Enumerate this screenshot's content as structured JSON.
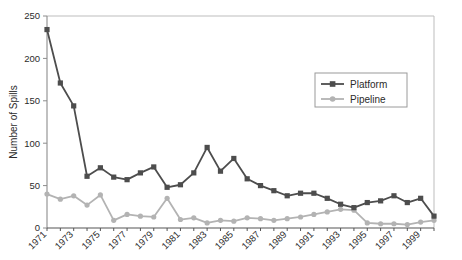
{
  "chart_data": {
    "type": "line",
    "title": "",
    "xlabel": "",
    "ylabel": "Number of Spills",
    "ylim": [
      0,
      250
    ],
    "yticks": [
      0,
      50,
      100,
      150,
      200,
      250
    ],
    "grid": false,
    "legend_position": "top-right",
    "x": [
      1971,
      1972,
      1973,
      1974,
      1975,
      1976,
      1977,
      1978,
      1979,
      1980,
      1981,
      1982,
      1983,
      1984,
      1985,
      1986,
      1987,
      1988,
      1989,
      1990,
      1991,
      1992,
      1993,
      1994,
      1995,
      1996,
      1997,
      1998,
      1999,
      2000
    ],
    "xtick_labels": [
      "1971",
      "1973",
      "1975",
      "1977",
      "1979",
      "1981",
      "1983",
      "1985",
      "1987",
      "1989",
      "1991",
      "1993",
      "1995",
      "1997",
      "1999"
    ],
    "xticks": [
      1971,
      1973,
      1975,
      1977,
      1979,
      1981,
      1983,
      1985,
      1987,
      1989,
      1991,
      1993,
      1995,
      1997,
      1999
    ],
    "series": [
      {
        "name": "Platform",
        "color": "#4d4d4d",
        "marker": "square",
        "values": [
          234,
          171,
          144,
          61,
          71,
          60,
          57,
          65,
          72,
          48,
          51,
          65,
          95,
          67,
          82,
          58,
          50,
          44,
          38,
          41,
          41,
          35,
          28,
          24,
          30,
          32,
          38,
          30,
          35,
          14
        ]
      },
      {
        "name": "Pipeline",
        "color": "#b3b3b3",
        "marker": "circle",
        "values": [
          40,
          34,
          38,
          27,
          39,
          9,
          16,
          14,
          13,
          35,
          10,
          12,
          6,
          9,
          8,
          12,
          11,
          9,
          11,
          13,
          16,
          19,
          22,
          21,
          6,
          5,
          5,
          4,
          7,
          9
        ]
      }
    ]
  },
  "legend": {
    "items": [
      {
        "label": "Platform"
      },
      {
        "label": "Pipeline"
      }
    ]
  },
  "axes": {
    "y_title": "Number of Spills"
  }
}
